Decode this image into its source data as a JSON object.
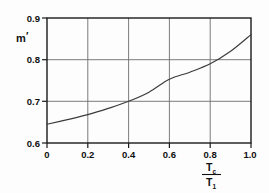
{
  "figure": {
    "background_color": "#fdfdfd",
    "axis_color": "#1a1a1a",
    "grid_color": "#6d6d6d",
    "curve_color": "#3b3b3b"
  },
  "chart_data": {
    "type": "line",
    "title": "",
    "xlabel": "Tc/T1",
    "xlabel_numerator": "T",
    "xlabel_numerator_sub": "c",
    "xlabel_denominator": "T",
    "xlabel_denominator_sub": "1",
    "ylabel": "m′",
    "ylabel_base": "m",
    "ylabel_prime": "′",
    "xlim": [
      0,
      1.0
    ],
    "ylim": [
      0.6,
      0.9
    ],
    "xticks": [
      0,
      0.2,
      0.4,
      0.6,
      0.8,
      1.0
    ],
    "xticklabels": [
      "0",
      "0.2",
      "0.4",
      "0.6",
      "0.8",
      "1.0"
    ],
    "yticks": [
      0.6,
      0.7,
      0.8,
      0.9
    ],
    "yticklabels": [
      "0.6",
      "0.7",
      "0.8",
      "0.9"
    ],
    "grid": true,
    "grid_axes": "both",
    "legend": false,
    "legend_position": "none",
    "x": [
      0.0,
      0.1,
      0.2,
      0.3,
      0.4,
      0.5,
      0.6,
      0.7,
      0.8,
      0.9,
      1.0
    ],
    "values": [
      0.645,
      0.656,
      0.668,
      0.683,
      0.7,
      0.722,
      0.753,
      0.77,
      0.79,
      0.82,
      0.86
    ],
    "series": [
      {
        "name": "m′ vs Tc/T1",
        "values": [
          0.645,
          0.656,
          0.668,
          0.683,
          0.7,
          0.722,
          0.753,
          0.77,
          0.79,
          0.82,
          0.86
        ]
      }
    ],
    "annotations": []
  },
  "ticks": {
    "y": [
      {
        "label": "0.9",
        "value": 0.9
      },
      {
        "label": "0.8",
        "value": 0.8
      },
      {
        "label": "0.7",
        "value": 0.7
      },
      {
        "label": "0.6",
        "value": 0.6
      }
    ],
    "x": [
      {
        "label": "0",
        "value": 0
      },
      {
        "label": "0.2",
        "value": 0.2
      },
      {
        "label": "0.4",
        "value": 0.4
      },
      {
        "label": "0.6",
        "value": 0.6
      },
      {
        "label": "0.8",
        "value": 0.8
      },
      {
        "label": "1.0",
        "value": 1.0
      }
    ]
  }
}
